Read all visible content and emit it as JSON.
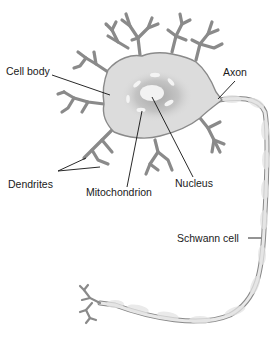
{
  "labels": {
    "cell_body": "Cell body",
    "axon": "Axon",
    "dendrites": "Dendrites",
    "mitochondrion": "Mitochondrion",
    "nucleus": "Nucleus",
    "schwann_cell": "Schwann cell"
  },
  "colors": {
    "cytoplasm": "#dcdcdc",
    "outline": "#8a8a8a",
    "nucleus_halo": "#b4b4b4",
    "nucleus": "#f2f2f2",
    "leader_line": "#111111",
    "myelin": "#e6e6e6"
  }
}
